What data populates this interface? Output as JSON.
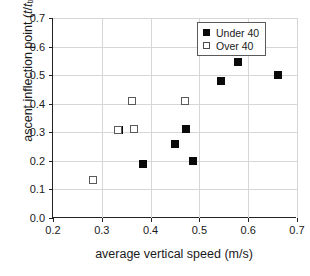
{
  "chart_data": {
    "type": "scatter",
    "title": "",
    "xlabel": "average vertical speed (m/s)",
    "ylabel_plain": "ascent inflection point (t/ttrace)",
    "ylabel_prefix": "ascent inflection point (",
    "ylabel_t1": "t",
    "ylabel_slash": "/",
    "ylabel_t2": "t",
    "ylabel_sub": "trace",
    "ylabel_suffix": ")",
    "xlim": [
      0.2,
      0.7
    ],
    "ylim": [
      0.0,
      0.7
    ],
    "xticks": [
      0.2,
      0.3,
      0.4,
      0.5,
      0.6,
      0.7
    ],
    "yticks": [
      0.0,
      0.1,
      0.2,
      0.3,
      0.4,
      0.5,
      0.6,
      0.7
    ],
    "xtick_labels": [
      "0.2",
      "0.3",
      "0.4",
      "0.5",
      "0.6",
      "0.7"
    ],
    "ytick_labels": [
      "0.0",
      "0.1",
      "0.2",
      "0.3",
      "0.4",
      "0.5",
      "0.6",
      "0.7"
    ],
    "grid": true,
    "grid_color": "#d6d6d6",
    "legend_position": "top-right",
    "series": [
      {
        "name": "Under 40",
        "marker": "filled-square",
        "color": "#0a0a0a",
        "points": [
          {
            "x": 0.335,
            "y": 0.308
          },
          {
            "x": 0.385,
            "y": 0.19
          },
          {
            "x": 0.45,
            "y": 0.26
          },
          {
            "x": 0.472,
            "y": 0.311
          },
          {
            "x": 0.486,
            "y": 0.2
          },
          {
            "x": 0.545,
            "y": 0.481
          },
          {
            "x": 0.58,
            "y": 0.546
          },
          {
            "x": 0.661,
            "y": 0.501
          }
        ]
      },
      {
        "name": "Over 40",
        "marker": "open-square",
        "color": "#5a5a5a",
        "points": [
          {
            "x": 0.281,
            "y": 0.133
          },
          {
            "x": 0.334,
            "y": 0.308
          },
          {
            "x": 0.366,
            "y": 0.31
          },
          {
            "x": 0.362,
            "y": 0.41
          },
          {
            "x": 0.47,
            "y": 0.41
          }
        ]
      }
    ]
  },
  "legend": {
    "items": [
      {
        "label": "Under 40",
        "marker": "filled-square"
      },
      {
        "label": "Over 40",
        "marker": "open-square"
      }
    ]
  }
}
